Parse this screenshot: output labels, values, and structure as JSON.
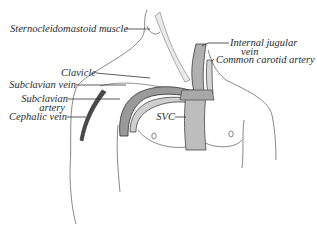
{
  "figure": {
    "type": "anatomical illustration",
    "labels": {
      "sternocleidomastoid": "Sternocleidomastoid muscle",
      "internal_jugular_line1": "Internal jugular",
      "internal_jugular_line2": "vein",
      "common_carotid": "Common carotid artery",
      "clavicle": "Clavicle",
      "subclavian_vein": "Subclavian vein",
      "subclavian_artery_line1": "Subclavian",
      "subclavian_artery_line2": "artery",
      "cephalic_vein": "Cephalic vein",
      "svc": "SVC"
    },
    "colors": {
      "ink": "#2a2a2a",
      "vessel_dark": "#3a3a3a",
      "vessel_shade": "#9a9a9a",
      "outline": "#555555",
      "background": "#ffffff"
    }
  }
}
